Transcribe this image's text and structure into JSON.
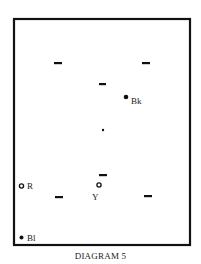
{
  "caption": "DIAGRAM 5",
  "colors": {
    "ink": "#111111",
    "background": "#ffffff"
  },
  "markers": [
    {
      "id": "dash-top-left",
      "kind": "dash"
    },
    {
      "id": "dash-top-right",
      "kind": "dash"
    },
    {
      "id": "dash-upper-center",
      "kind": "dash"
    },
    {
      "id": "dash-lower-left",
      "kind": "dash"
    },
    {
      "id": "dash-lower-center",
      "kind": "dash"
    },
    {
      "id": "dash-lower-right",
      "kind": "dash"
    },
    {
      "id": "center-spot",
      "kind": "small-dot"
    }
  ],
  "balls": [
    {
      "id": "black",
      "label": "Bk",
      "style": "solid"
    },
    {
      "id": "red",
      "label": "R",
      "style": "hollow"
    },
    {
      "id": "yellow",
      "label": "Y",
      "style": "hollow"
    },
    {
      "id": "blue",
      "label": "Bl",
      "style": "solid"
    }
  ]
}
